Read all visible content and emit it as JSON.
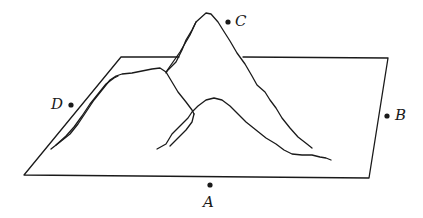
{
  "diagram": {
    "colors": {
      "ink": "#1a1a1a",
      "background": "#ffffff"
    },
    "points": [
      {
        "id": "C",
        "label": "C",
        "position": "near summit, right side"
      },
      {
        "id": "D",
        "label": "D",
        "position": "left of plane"
      },
      {
        "id": "B",
        "label": "B",
        "position": "right edge of plane"
      },
      {
        "id": "A",
        "label": "A",
        "position": "below front edge of plane"
      }
    ]
  }
}
